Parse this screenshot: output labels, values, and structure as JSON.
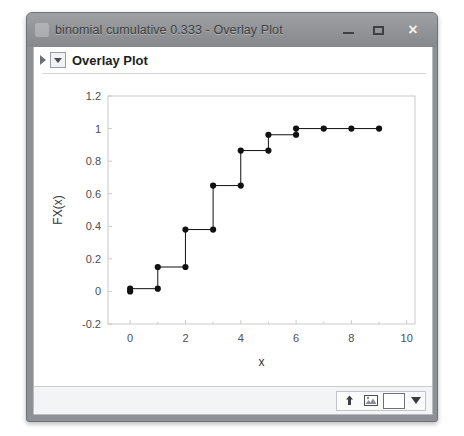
{
  "window": {
    "title": "binomial cumulative 0.333 - Overlay Plot",
    "icon": "app-icon",
    "controls": {
      "minimize_label": "",
      "maximize_label": "",
      "close_label": "×"
    }
  },
  "report": {
    "title": "Overlay Plot",
    "disclosure_icon": "disclosure-triangle-icon",
    "menu_icon": "red-triangle-menu-icon"
  },
  "status_bar": {
    "tools": [
      {
        "name": "up-arrow-icon",
        "label": "⇧"
      },
      {
        "name": "image-icon",
        "label": ""
      },
      {
        "name": "color-swatch",
        "label": ""
      },
      {
        "name": "dropdown-caret-icon",
        "label": ""
      }
    ]
  },
  "colors": {
    "title_bar": "#939598",
    "frame": "#8e9093",
    "plot_background": "#ffffff",
    "axis": "#c8cacc",
    "series": "#111111",
    "status_bar": "#f3f4f5"
  },
  "chart_data": {
    "type": "line",
    "title": "",
    "xlabel": "x",
    "ylabel": "FX(x)",
    "xlim": [
      -0.8,
      10.3
    ],
    "ylim": [
      -0.2,
      1.2
    ],
    "xticks": [
      0,
      2,
      4,
      6,
      8,
      10
    ],
    "xticklabels": [
      "0",
      "2",
      "4",
      "6",
      "8",
      "10"
    ],
    "xminorticks": [
      1,
      3,
      5,
      7,
      9
    ],
    "yticks": [
      -0.2,
      0,
      0.2,
      0.4,
      0.6,
      0.8,
      1,
      1.2
    ],
    "yticklabels": [
      "-0.2",
      "0",
      "0.2",
      "0.4",
      "0.6",
      "0.8",
      "1",
      "1.2"
    ],
    "grid": false,
    "legend": false,
    "step_style": "post",
    "markers": true,
    "series": [
      {
        "name": "FX(x)",
        "x": [
          0,
          0,
          1,
          1,
          2,
          2,
          3,
          3,
          4,
          4,
          5,
          5,
          6,
          6,
          7,
          8,
          9
        ],
        "y": [
          0.0,
          0.017,
          0.017,
          0.15,
          0.15,
          0.38,
          0.38,
          0.65,
          0.65,
          0.865,
          0.865,
          0.962,
          0.962,
          1.0,
          1.0,
          1.0,
          1.0
        ]
      }
    ],
    "points": [
      {
        "x": 0,
        "y": 0.0
      },
      {
        "x": 0,
        "y": 0.017
      },
      {
        "x": 1,
        "y": 0.017
      },
      {
        "x": 1,
        "y": 0.15
      },
      {
        "x": 2,
        "y": 0.15
      },
      {
        "x": 2,
        "y": 0.38
      },
      {
        "x": 3,
        "y": 0.38
      },
      {
        "x": 3,
        "y": 0.65
      },
      {
        "x": 4,
        "y": 0.65
      },
      {
        "x": 4,
        "y": 0.865
      },
      {
        "x": 5,
        "y": 0.865
      },
      {
        "x": 5,
        "y": 0.962
      },
      {
        "x": 6,
        "y": 0.962
      },
      {
        "x": 6,
        "y": 1.0
      },
      {
        "x": 7,
        "y": 1.0
      },
      {
        "x": 8,
        "y": 1.0
      },
      {
        "x": 9,
        "y": 1.0
      }
    ]
  }
}
